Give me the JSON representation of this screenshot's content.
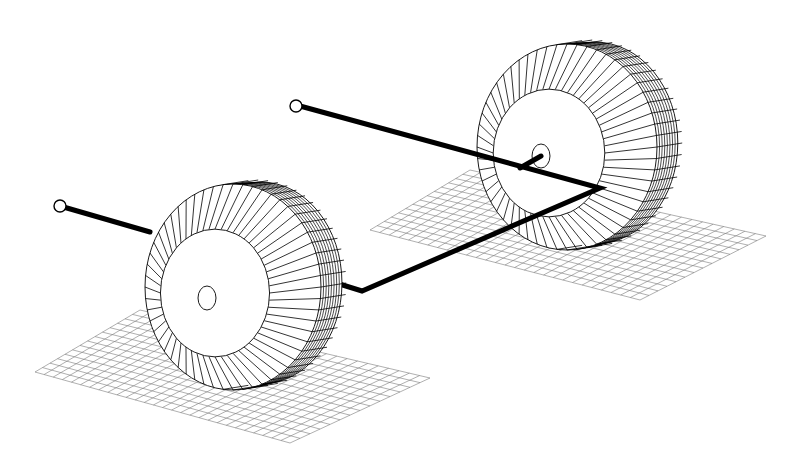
{
  "figure": {
    "background": "#ffffff",
    "line_color": "#000000",
    "grid_color": "#7a7a7a"
  },
  "components": {
    "front_tire": {
      "center": [
        233,
        287
      ],
      "rx": 88,
      "ry": 103,
      "hub_center": [
        207,
        298
      ]
    },
    "rear_tire": {
      "center": [
        567,
        147
      ],
      "rx": 90,
      "ry": 103,
      "hub_center": [
        541,
        156
      ]
    },
    "front_ground_grid": {
      "corners": [
        [
          35,
          372
        ],
        [
          140,
          310
        ],
        [
          430,
          378
        ],
        [
          290,
          443
        ]
      ]
    },
    "rear_ground_grid": {
      "corners": [
        [
          370,
          230
        ],
        [
          470,
          170
        ],
        [
          766,
          236
        ],
        [
          640,
          300
        ]
      ]
    },
    "linkage": {
      "points": [
        [
          60,
          206
        ],
        [
          150,
          232
        ],
        [
          320,
          278
        ],
        [
          362,
          291
        ],
        [
          600,
          188
        ],
        [
          300,
          106
        ]
      ],
      "axle_stub": [
        [
          541,
          156
        ],
        [
          520,
          168
        ]
      ]
    },
    "ball_joints": [
      {
        "center": [
          60,
          206
        ],
        "r": 6
      },
      {
        "center": [
          296,
          106
        ],
        "r": 6
      }
    ]
  }
}
